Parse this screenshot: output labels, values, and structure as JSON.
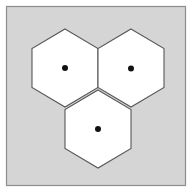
{
  "figure": {
    "canvas": {
      "width": 192,
      "height": 195,
      "background_color": "#ffffff"
    },
    "panel": {
      "label": "diagram-panel",
      "x": 6.5,
      "y": 6.5,
      "width": 179,
      "height": 179,
      "fill_color": "#d5d5d5",
      "border_color": "#8c8c8c",
      "border_width": 1.2
    },
    "shapes": {
      "kind": "hexagon",
      "orientation": "pointy-top",
      "count": 3,
      "fill_color": "#ffffff",
      "stroke_color": "#585858",
      "stroke_width": 1.1,
      "circumradius": 39,
      "halfwidth": 33,
      "items": [
        {
          "name": "hexagon-top-left",
          "label": "Hexagon 1",
          "center_x": 65,
          "center_y": 68,
          "points": "65,29 98,48.5 98,87.5 65,107 32,87.5 32,48.5"
        },
        {
          "name": "hexagon-top-right",
          "label": "Hexagon 2",
          "center_x": 131,
          "center_y": 68,
          "points": "131,29 164,48.5 164,87.5 131,107 98,87.5 98,48.5"
        },
        {
          "name": "hexagon-bottom-center",
          "label": "Hexagon 3",
          "center_x": 98,
          "center_y": 129,
          "points": "98,90 131,109.5 131,148.5 98,168 65,148.5 65,109.5"
        }
      ]
    },
    "center_dots": {
      "name": "center-dot",
      "fill_color": "#111111",
      "radius": 3,
      "items": [
        {
          "name": "center-dot-top-left",
          "cx": 65,
          "cy": 68
        },
        {
          "name": "center-dot-top-right",
          "cx": 131,
          "cy": 68.5
        },
        {
          "name": "center-dot-bottom-center",
          "cx": 98,
          "cy": 129
        }
      ]
    }
  }
}
